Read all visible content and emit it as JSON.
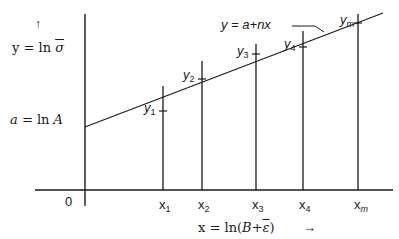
{
  "diagram": {
    "type": "linear-regression-log-plot",
    "y_axis": {
      "arrow": "↑",
      "label_var": "y",
      "label_eq": " = ln ",
      "label_sym": "σ"
    },
    "x_axis": {
      "label_var": "x",
      "label_eq": " = ln(",
      "label_sym": "B+",
      "label_sym2": "ε",
      "label_close": ")",
      "arrow": "→",
      "origin": "0"
    },
    "intercept": {
      "var": "a",
      "eq": " = ln ",
      "sym": "A"
    },
    "line_label": {
      "text": "y = a+nx"
    },
    "points": [
      {
        "x_label": "x",
        "x_sub": "1",
        "y_label": "y",
        "y_sub": "1"
      },
      {
        "x_label": "x",
        "x_sub": "2",
        "y_label": "y",
        "y_sub": "2"
      },
      {
        "x_label": "x",
        "x_sub": "3",
        "y_label": "y",
        "y_sub": "3"
      },
      {
        "x_label": "x",
        "x_sub": "4",
        "y_label": "y",
        "y_sub": "4"
      },
      {
        "x_label": "x",
        "x_sub": "m",
        "y_label": "y",
        "y_sub": "m"
      }
    ],
    "colors": {
      "ink": "#1a1a1a",
      "background": "#ffffff"
    }
  }
}
